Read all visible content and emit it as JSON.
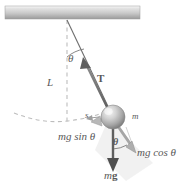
{
  "figure": {
    "colors": {
      "ceiling_light": "#f2f2f2",
      "ceiling_dark": "#8c8c8c",
      "line": "#6e6e6e",
      "dashed": "#b0b0b0",
      "arrow": "#5a5a5a",
      "bob_light": "#e8e8e8",
      "bob_dark": "#7a7a7a",
      "text": "#595959",
      "shadow": "#e4e4e4"
    },
    "ceiling": {
      "label": "support-ceiling",
      "x": 5,
      "y": 6,
      "width": 135,
      "height": 13
    },
    "pivot": {
      "x": 67,
      "y": 19
    },
    "bob": {
      "x": 113,
      "y": 117,
      "radius": 12
    }
  },
  "labels": {
    "length": "L",
    "angle_top": "θ",
    "angle_bob": "θ",
    "tension": "T",
    "mass": "m",
    "arc_length": "s",
    "mg_sin_theta": "mg sin θ",
    "mg_cos_theta": "mg cos θ",
    "weight_prefix": "m",
    "weight_vector": "g"
  },
  "elements": {
    "ceiling_name": "ceiling-support",
    "string_name": "pendulum-string",
    "vertical_dashed_name": "vertical-reference-line",
    "arc_dashed_name": "swing-path-arc",
    "angle_arc_top_name": "angle-arc-top",
    "angle_arc_bob_name": "angle-arc-bob",
    "tension_arrow_name": "tension-vector-arrow",
    "weight_arrow_name": "weight-vector-arrow",
    "mg_sin_arrow_name": "mg-sin-theta-vector-arrow",
    "mg_cos_arrow_name": "mg-cos-theta-vector-arrow",
    "arc_length_arrow_name": "arc-length-indicator",
    "bob_name": "pendulum-bob",
    "component_rect_name": "force-component-rectangle"
  }
}
